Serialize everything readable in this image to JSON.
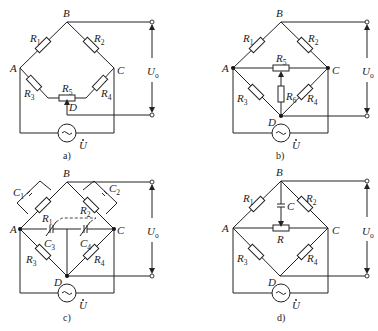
{
  "figure": {
    "panels": [
      {
        "id": "a",
        "caption": "a)",
        "nodes": [
          "A",
          "B",
          "C",
          "D"
        ],
        "components": [
          "R1",
          "R2",
          "R3",
          "R4",
          "R5"
        ],
        "source": "U",
        "output": "Uo",
        "labels": {
          "A": "A",
          "B": "B",
          "C": "C",
          "D": "D",
          "R1": "R",
          "R1s": "1",
          "R2": "R",
          "R2s": "2",
          "R3": "R",
          "R3s": "3",
          "R4": "R",
          "R4s": "4",
          "R5": "R",
          "R5s": "5",
          "U": "U",
          "Uo": "U",
          "Uos": "o"
        }
      },
      {
        "id": "b",
        "caption": "b)",
        "nodes": [
          "A",
          "B",
          "C",
          "D"
        ],
        "components": [
          "R1",
          "R2",
          "R3",
          "R4",
          "R5",
          "R6"
        ],
        "source": "U",
        "output": "Uo",
        "labels": {
          "A": "A",
          "B": "B",
          "C": "C",
          "D": "D",
          "R1": "R",
          "R1s": "1",
          "R2": "R",
          "R2s": "2",
          "R3": "R",
          "R3s": "3",
          "R4": "R",
          "R4s": "4",
          "R5": "R",
          "R5s": "5",
          "R6": "R",
          "R6s": "6",
          "U": "U",
          "Uo": "U",
          "Uos": "o"
        }
      },
      {
        "id": "c",
        "caption": "c)",
        "nodes": [
          "A",
          "B",
          "C",
          "D"
        ],
        "components": [
          "R1",
          "R2",
          "R3",
          "R4",
          "C1",
          "C2",
          "C3",
          "C4"
        ],
        "source": "U",
        "output": "Uo",
        "labels": {
          "A": "A",
          "B": "B",
          "C": "C",
          "D": "D",
          "R1": "R",
          "R1s": "1",
          "R2": "R",
          "R2s": "2",
          "R3": "R",
          "R3s": "3",
          "R4": "R",
          "R4s": "4",
          "C1": "C",
          "C1s": "1",
          "C2": "C",
          "C2s": "2",
          "C3": "C",
          "C3s": "3",
          "C4": "C",
          "C4s": "4",
          "U": "U",
          "Uo": "U",
          "Uos": "o"
        }
      },
      {
        "id": "d",
        "caption": "d)",
        "nodes": [
          "A",
          "B",
          "C",
          "D"
        ],
        "components": [
          "R1",
          "R2",
          "R3",
          "R4",
          "R",
          "C"
        ],
        "source": "U",
        "output": "Uo",
        "labels": {
          "A": "A",
          "B": "B",
          "C": "C",
          "D": "D",
          "R1": "R",
          "R1s": "1",
          "R2": "R",
          "R2s": "2",
          "R3": "R",
          "R3s": "3",
          "R4": "R",
          "R4s": "4",
          "R": "R",
          "Cap": "C",
          "U": "U",
          "Uo": "U",
          "Uos": "o"
        }
      }
    ]
  }
}
